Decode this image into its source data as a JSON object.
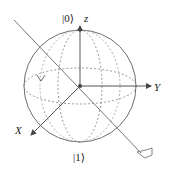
{
  "diagram": {
    "type": "bloch-sphere",
    "labels": {
      "top_state": "|0⟩",
      "bottom_state": "|1⟩",
      "z_axis": "z",
      "y_axis": "Y",
      "x_axis": "X"
    },
    "colors": {
      "stroke": "#6e6e6e",
      "dashed": "#8a8a8a",
      "text": "#222222",
      "background": "#ffffff"
    }
  }
}
